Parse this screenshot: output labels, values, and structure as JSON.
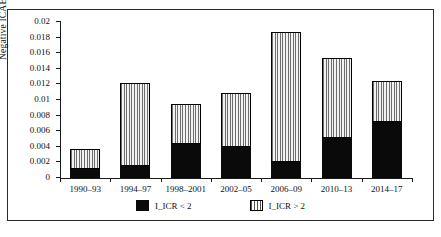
{
  "chart_data": {
    "type": "bar",
    "stacked": true,
    "title": "",
    "xlabel": "",
    "ylabel": "Negative ICAE",
    "ylim": [
      0,
      0.02
    ],
    "ytick_values": [
      0,
      0.002,
      0.004,
      0.006,
      0.008,
      0.01,
      0.012,
      0.014,
      0.016,
      0.018,
      0.02
    ],
    "ytick_labels": [
      "0",
      "0.002",
      "0.004",
      "0.006",
      "0.008",
      "0.01",
      "0.012",
      "0.014",
      "0.016",
      "0.018",
      "0.02"
    ],
    "grid": false,
    "legend_position": "bottom",
    "categories": [
      "1990–93",
      "1994–97",
      "1998–2001",
      "2002–05",
      "2006–09",
      "2010–13",
      "2014–17"
    ],
    "series": [
      {
        "name": "I_ICR < 2",
        "pattern": "solid",
        "color": "#0a0a0a",
        "values": [
          0.0011,
          0.0015,
          0.0043,
          0.004,
          0.0021,
          0.0051,
          0.0072
        ]
      },
      {
        "name": "I_ICR > 2",
        "pattern": "vertical-stripes",
        "color": "#6d6d6d",
        "values": [
          0.0026,
          0.0107,
          0.0052,
          0.0069,
          0.0166,
          0.0103,
          0.0053
        ]
      }
    ],
    "totals": [
      0.0037,
      0.0122,
      0.0095,
      0.0109,
      0.0187,
      0.0154,
      0.0125
    ]
  },
  "legend": {
    "items": [
      {
        "label": "I_ICR < 2",
        "swatch": "solid-black-square"
      },
      {
        "label": "I_ICR > 2",
        "swatch": "vertical-striped-square"
      }
    ]
  }
}
